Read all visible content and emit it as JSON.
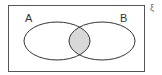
{
  "diagram": {
    "type": "venn",
    "universal_symbol": "ξ",
    "sets": [
      {
        "label": "A"
      },
      {
        "label": "B"
      }
    ],
    "shaded_region": "A ∩ B",
    "colors": {
      "outline": "#333333",
      "shade": "#d8d8d8",
      "frame": "#555555"
    }
  }
}
